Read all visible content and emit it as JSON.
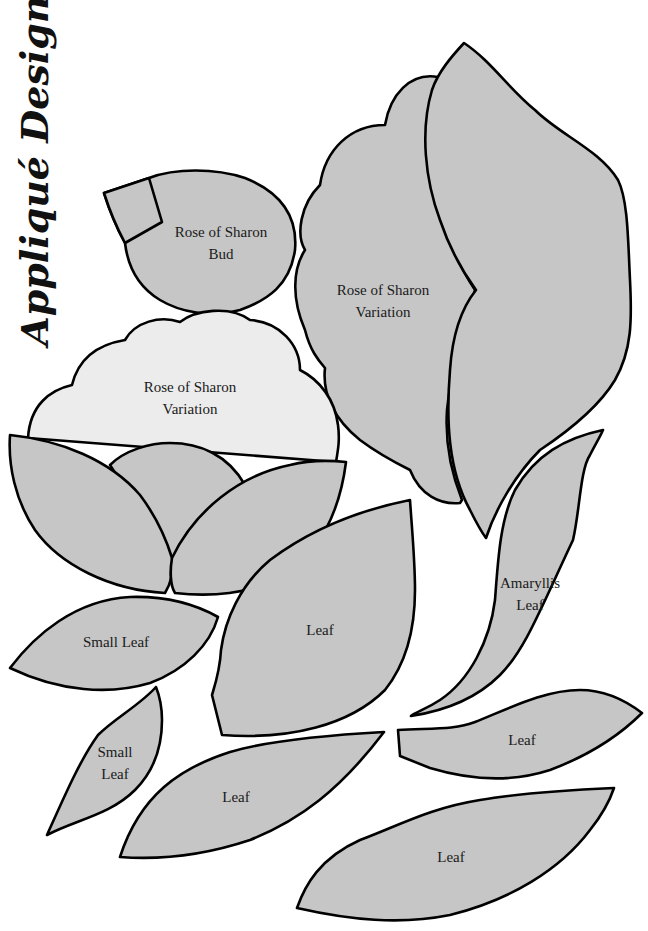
{
  "page": {
    "title": "Appliqué Designs",
    "colors": {
      "background": "#ffffff",
      "shape_fill": "#c6c6c6",
      "shape_fill_light": "#ececec",
      "outline": "#000000",
      "text": "#1a1a1a"
    }
  },
  "shapes": [
    {
      "id": "rose-bud",
      "label_line1": "Rose of Sharon",
      "label_line2": "Bud"
    },
    {
      "id": "rose-variation-right",
      "label_line1": "Rose of Sharon",
      "label_line2": "Variation"
    },
    {
      "id": "rose-variation-left",
      "label_line1": "Rose of Sharon",
      "label_line2": "Variation"
    },
    {
      "id": "amaryllis-leaf",
      "label_line1": "Amaryllis",
      "label_line2": "Leaf"
    },
    {
      "id": "small-leaf-horizontal",
      "label_line1": "Small Leaf"
    },
    {
      "id": "leaf-large-center",
      "label_line1": "Leaf"
    },
    {
      "id": "leaf-right-small",
      "label_line1": "Leaf"
    },
    {
      "id": "small-leaf-vertical",
      "label_line1": "Small",
      "label_line2": "Leaf"
    },
    {
      "id": "leaf-bottom-center",
      "label_line1": "Leaf"
    },
    {
      "id": "leaf-bottom-right",
      "label_line1": "Leaf"
    }
  ]
}
